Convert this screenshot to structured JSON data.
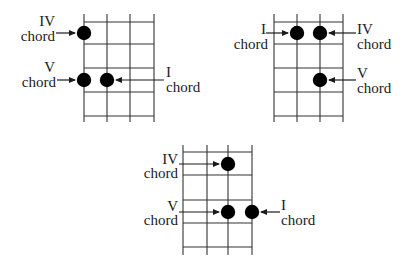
{
  "diagram": {
    "colors": {
      "line": "#333333",
      "dot": "#000000",
      "text": "#1a1a1a"
    },
    "grids": [
      {
        "id": "top-left",
        "strings_x": [
          84,
          107,
          130,
          154
        ],
        "frets_y": [
          22,
          44,
          68,
          92,
          116
        ],
        "top": 14,
        "bottom": 122,
        "dots": [
          {
            "x": 84,
            "y": 33,
            "chord": "IV"
          },
          {
            "x": 84,
            "y": 80,
            "chord": "V"
          },
          {
            "x": 107,
            "y": 80,
            "chord": "I"
          }
        ],
        "labels": [
          {
            "numeral": "IV",
            "word": "chord",
            "side": "left",
            "nx": 55,
            "ny": 26,
            "wx": 55,
            "wy": 41,
            "arrow": {
              "x1": 56,
              "y": 33,
              "x2": 75
            }
          },
          {
            "numeral": "V",
            "word": "chord",
            "side": "left",
            "nx": 55,
            "ny": 72,
            "wx": 56,
            "wy": 87,
            "arrow": {
              "x1": 57,
              "y": 80,
              "x2": 75
            }
          },
          {
            "numeral": "I",
            "word": "chord",
            "side": "right",
            "nx": 166,
            "ny": 77,
            "wx": 166,
            "wy": 92,
            "arrow": {
              "x1": 164,
              "y": 80,
              "x2": 116
            }
          }
        ]
      },
      {
        "id": "top-right",
        "strings_x": [
          274,
          297,
          320,
          343
        ],
        "frets_y": [
          22,
          44,
          68,
          92,
          116
        ],
        "top": 14,
        "bottom": 122,
        "dots": [
          {
            "x": 297,
            "y": 33,
            "chord": "I"
          },
          {
            "x": 320,
            "y": 33,
            "chord": "IV"
          },
          {
            "x": 320,
            "y": 80,
            "chord": "V"
          }
        ],
        "labels": [
          {
            "numeral": "I",
            "word": "chord",
            "side": "left",
            "nx": 266,
            "ny": 34,
            "wx": 268,
            "wy": 49,
            "arrow": {
              "x1": 266,
              "y": 33,
              "x2": 288
            }
          },
          {
            "numeral": "IV",
            "word": "chord",
            "side": "right",
            "nx": 357,
            "ny": 34,
            "wx": 357,
            "wy": 49,
            "arrow": {
              "x1": 356,
              "y": 33,
              "x2": 329
            }
          },
          {
            "numeral": "V",
            "word": "chord",
            "side": "right",
            "nx": 357,
            "ny": 78,
            "wx": 357,
            "wy": 93,
            "arrow": {
              "x1": 356,
              "y": 80,
              "x2": 329
            }
          }
        ]
      },
      {
        "id": "bottom-center",
        "strings_x": [
          183,
          207,
          228,
          252
        ],
        "frets_y": [
          152,
          175,
          200,
          223,
          247
        ],
        "top": 145,
        "bottom": 255,
        "dots": [
          {
            "x": 228,
            "y": 164,
            "chord": "IV"
          },
          {
            "x": 228,
            "y": 212,
            "chord": "V"
          },
          {
            "x": 252,
            "y": 212,
            "chord": "I"
          }
        ],
        "labels": [
          {
            "numeral": "IV",
            "word": "chord",
            "side": "left",
            "nx": 178,
            "ny": 164,
            "wx": 178,
            "wy": 178,
            "arrow": {
              "x1": 179,
              "y": 164,
              "x2": 219
            }
          },
          {
            "numeral": "V",
            "word": "chord",
            "side": "left",
            "nx": 178,
            "ny": 211,
            "wx": 178,
            "wy": 225,
            "arrow": {
              "x1": 179,
              "y": 212,
              "x2": 219
            }
          },
          {
            "numeral": "I",
            "word": "chord",
            "side": "right",
            "nx": 281,
            "ny": 210,
            "wx": 281,
            "wy": 225,
            "arrow": {
              "x1": 280,
              "y": 212,
              "x2": 261
            }
          }
        ]
      }
    ]
  }
}
